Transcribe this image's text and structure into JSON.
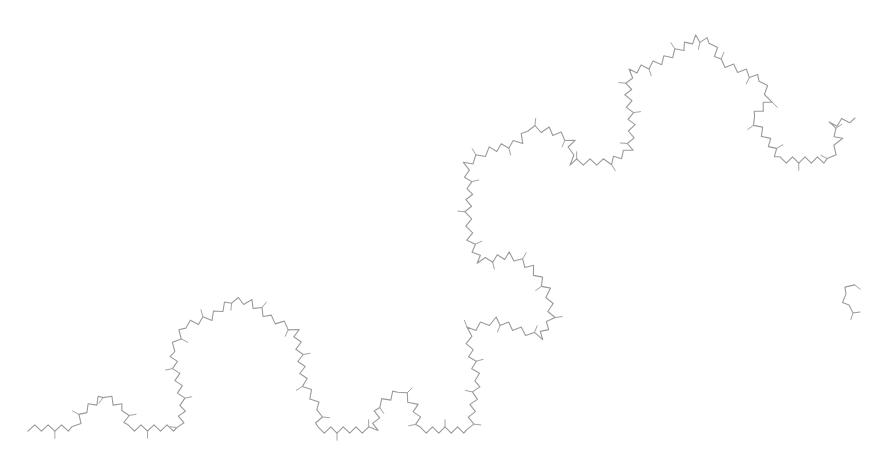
{
  "figure": {
    "kind": "skeletal-formula",
    "background_color": "#ffffff",
    "bond_color": "#9a9a9a",
    "labels": []
  },
  "backbone": {
    "main_path": [
      [
        28,
        428
      ],
      [
        75,
        428
      ],
      [
        85,
        410
      ],
      [
        105,
        395
      ],
      [
        125,
        410
      ],
      [
        128,
        428
      ],
      [
        180,
        428
      ],
      [
        183,
        405
      ],
      [
        178,
        380
      ],
      [
        172,
        350
      ],
      [
        185,
        325
      ],
      [
        210,
        318
      ],
      [
        232,
        300
      ],
      [
        250,
        302
      ],
      [
        270,
        318
      ],
      [
        296,
        330
      ],
      [
        300,
        355
      ],
      [
        305,
        385
      ],
      [
        320,
        410
      ],
      [
        318,
        430
      ],
      [
        375,
        430
      ],
      [
        378,
        405
      ],
      [
        400,
        390
      ],
      [
        415,
        405
      ],
      [
        420,
        430
      ],
      [
        470,
        430
      ],
      [
        473,
        405
      ],
      [
        478,
        380
      ],
      [
        470,
        350
      ],
      [
        468,
        330
      ],
      [
        495,
        320
      ],
      [
        520,
        330
      ],
      [
        540,
        338
      ],
      [
        552,
        318
      ],
      [
        548,
        290
      ],
      [
        532,
        268
      ],
      [
        510,
        255
      ],
      [
        480,
        262
      ],
      [
        470,
        240
      ],
      [
        468,
        212
      ],
      [
        470,
        188
      ],
      [
        465,
        165
      ],
      [
        490,
        150
      ],
      [
        520,
        142
      ],
      [
        528,
        128
      ],
      [
        548,
        130
      ],
      [
        572,
        140
      ],
      [
        570,
        162
      ],
      [
        610,
        162
      ],
      [
        630,
        150
      ],
      [
        632,
        125
      ],
      [
        628,
        95
      ],
      [
        630,
        72
      ],
      [
        660,
        62
      ],
      [
        682,
        48
      ],
      [
        695,
        38
      ],
      [
        712,
        42
      ],
      [
        720,
        62
      ],
      [
        745,
        72
      ],
      [
        762,
        80
      ],
      [
        770,
        100
      ],
      [
        752,
        118
      ],
      [
        768,
        140
      ],
      [
        780,
        160
      ],
      [
        830,
        160
      ],
      [
        840,
        140
      ],
      [
        830,
        125
      ],
      [
        855,
        118
      ]
    ],
    "fragment_path": [
      [
        852,
        283
      ],
      [
        843,
        295
      ],
      [
        848,
        308
      ],
      [
        860,
        312
      ]
    ]
  }
}
